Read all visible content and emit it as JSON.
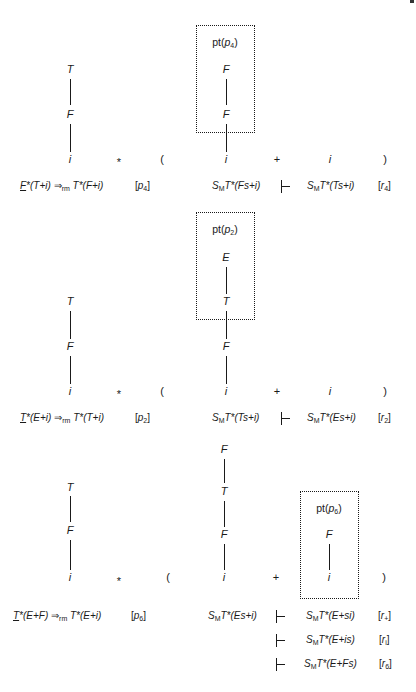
{
  "blocks": [
    {
      "left_tree": [
        "T",
        "F",
        "i"
      ],
      "star": "*",
      "lparen": "(",
      "middle_tree": [
        "F",
        "F",
        "i"
      ],
      "plus": "+",
      "right_leaf": "i",
      "rparen": ")",
      "box_label": {
        "prefix": "pt(",
        "sym": "p",
        "sub": "4",
        "suffix": ")"
      },
      "left_formula": {
        "underlined": "F",
        "rest": "*(T+i)",
        "arrow": "⇒",
        "arrow_sub": "rm",
        "result": "T*(F+i)"
      },
      "left_tag": {
        "sym": "p",
        "sub": "4"
      },
      "derivations": [
        {
          "from": "T*(Fs+i)",
          "to": "T*(Ts+i)",
          "rule": {
            "sym": "r",
            "sub": "4"
          }
        }
      ]
    },
    {
      "left_tree": [
        "T",
        "F",
        "i"
      ],
      "star": "*",
      "lparen": "(",
      "middle_tree": [
        "E",
        "T",
        "F",
        "i"
      ],
      "plus": "+",
      "right_leaf": "i",
      "rparen": ")",
      "box_label": {
        "prefix": "pt(",
        "sym": "p",
        "sub": "2",
        "suffix": ")"
      },
      "left_formula": {
        "underlined": "T",
        "rest": "*(E+i)",
        "arrow": "⇒",
        "arrow_sub": "rm",
        "result": "T*(T+i)"
      },
      "left_tag": {
        "sym": "p",
        "sub": "2"
      },
      "derivations": [
        {
          "from": "T*(Ts+i)",
          "to": "T*(Es+i)",
          "rule": {
            "sym": "r",
            "sub": "2"
          }
        }
      ]
    },
    {
      "left_tree": [
        "T",
        "F",
        "i"
      ],
      "star": "*",
      "lparen": "(",
      "middle_tree": [
        "F",
        "T",
        "F",
        "i"
      ],
      "plus": "+",
      "right_tree": [
        "F",
        "i"
      ],
      "rparen": ")",
      "box_label": {
        "prefix": "pt(",
        "sym": "p",
        "sub": "6",
        "suffix": ")"
      },
      "left_formula": {
        "underlined": "T",
        "rest": "*(E+F)",
        "arrow": "⇒",
        "arrow_sub": "rm",
        "result": "T*(E+i)"
      },
      "left_tag": {
        "sym": "p",
        "sub": "6"
      },
      "derivations": [
        {
          "from": "T*(Es+i)",
          "to": "T*(E+si)",
          "rule": {
            "sym": "r",
            "sub": "+"
          }
        },
        {
          "to": "T*(E+is)",
          "rule": {
            "sym": "r",
            "sub": "i"
          }
        },
        {
          "to": "T*(E+Fs)",
          "rule": {
            "sym": "r",
            "sub": "6"
          }
        }
      ]
    }
  ],
  "stack_prefix": {
    "sym": "S",
    "sub": "M"
  },
  "turnstile": "⊢"
}
